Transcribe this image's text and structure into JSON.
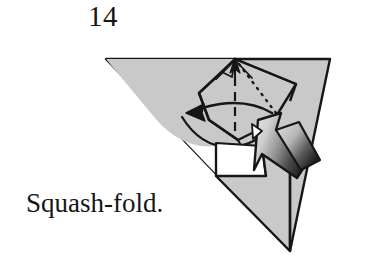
{
  "figure": {
    "step_number": "14",
    "caption": "Squash-fold.",
    "kind": "origami-instruction-diagram",
    "background_color": "#ffffff",
    "ink_color": "#161616",
    "paper_front_color": "#c9c9c9",
    "paper_back_color": "#ffffff",
    "arrow_light_color": "#d4d4d4",
    "arrow_dark_color": "#2b2b2b",
    "elements": [
      {
        "name": "main-triangle",
        "label": "large folded paper body",
        "fill": "#c9c9c9"
      },
      {
        "name": "kite-flap",
        "label": "central kite shaped flap to be squashed",
        "fill": "#c9c9c9"
      },
      {
        "name": "lower-flap",
        "label": "lower triangular flap",
        "fill": "#c9c9c9"
      },
      {
        "name": "valley-fold-line",
        "label": "dashed valley fold crease",
        "style": "dashed"
      },
      {
        "name": "hidden-edge-line",
        "label": "dotted hidden edge",
        "style": "dotted"
      },
      {
        "name": "rotation-arrow",
        "label": "curved arrow indicating flap swings left",
        "direction": "left"
      },
      {
        "name": "apex-arrow",
        "label": "small arrow pointing up to apex",
        "direction": "up"
      },
      {
        "name": "push-arrow",
        "label": "hollow shaded push-here arrow",
        "direction": "up-left"
      }
    ]
  }
}
